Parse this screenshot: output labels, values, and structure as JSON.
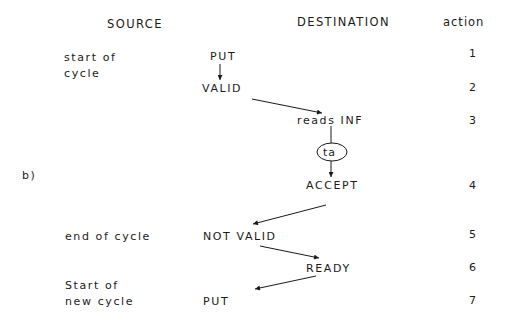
{
  "headers": {
    "source": "SOURCE",
    "destination": "DESTINATION",
    "action": "action"
  },
  "label": "b)",
  "source_notes": {
    "start_line1": "start of",
    "start_line2": "cycle",
    "end": "end of cycle",
    "new_line1": "Start of",
    "new_line2": "new cycle"
  },
  "nodes": {
    "put_top": "PUT",
    "valid": "VALID",
    "reads_inf": "reads INF",
    "ta": "ta",
    "accept": "ACCEPT",
    "not_valid": "NOT VALID",
    "ready": "READY",
    "put_bottom": "PUT"
  },
  "actions": [
    "1",
    "2",
    "3",
    "4",
    "5",
    "6",
    "7"
  ],
  "edges": [
    {
      "from": "PUT",
      "to": "VALID"
    },
    {
      "from": "VALID",
      "to": "reads INF"
    },
    {
      "from": "reads INF",
      "to": "ta"
    },
    {
      "from": "ta",
      "to": "ACCEPT"
    },
    {
      "from": "ACCEPT",
      "to": "NOT VALID"
    },
    {
      "from": "NOT VALID",
      "to": "READY"
    },
    {
      "from": "READY",
      "to": "PUT"
    }
  ],
  "colors": {
    "ink": "#1a1a1a",
    "background": "#ffffff"
  }
}
